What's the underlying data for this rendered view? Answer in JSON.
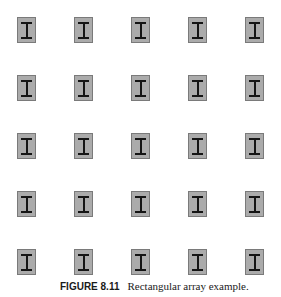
{
  "figure": {
    "label": "FIGURE 8.11",
    "caption": "Rectangular array example."
  },
  "array": {
    "rows": 5,
    "columns": 5,
    "element": "I-beam symbol in gray box",
    "column_x": [
      17,
      74,
      131,
      188,
      245
    ],
    "row_y": [
      17,
      75,
      133,
      191,
      249
    ],
    "colors": {
      "fill": "#ababab",
      "border": "#7a7a7a",
      "symbol": "#151515"
    }
  }
}
